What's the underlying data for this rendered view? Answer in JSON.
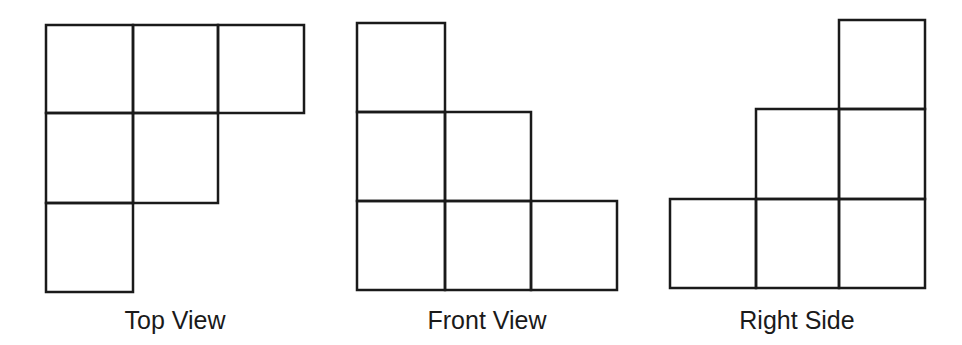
{
  "views": [
    {
      "id": "top",
      "label": "Top View",
      "label_center_x": 175,
      "cells": [
        {
          "row": 0,
          "col": 0,
          "x": 46,
          "y": 25,
          "w": 87,
          "h": 88
        },
        {
          "row": 0,
          "col": 1,
          "x": 133,
          "y": 25,
          "w": 85,
          "h": 88
        },
        {
          "row": 0,
          "col": 2,
          "x": 218,
          "y": 25,
          "w": 86,
          "h": 88
        },
        {
          "row": 1,
          "col": 0,
          "x": 46,
          "y": 113,
          "w": 87,
          "h": 90
        },
        {
          "row": 1,
          "col": 1,
          "x": 133,
          "y": 113,
          "w": 85,
          "h": 90
        },
        {
          "row": 2,
          "col": 0,
          "x": 46,
          "y": 203,
          "w": 87,
          "h": 89
        }
      ]
    },
    {
      "id": "front",
      "label": "Front View",
      "label_center_x": 487,
      "cells": [
        {
          "row": 0,
          "col": 0,
          "x": 357,
          "y": 23,
          "w": 88,
          "h": 89
        },
        {
          "row": 1,
          "col": 0,
          "x": 357,
          "y": 112,
          "w": 88,
          "h": 89
        },
        {
          "row": 1,
          "col": 1,
          "x": 445,
          "y": 112,
          "w": 86,
          "h": 89
        },
        {
          "row": 2,
          "col": 0,
          "x": 357,
          "y": 201,
          "w": 88,
          "h": 89
        },
        {
          "row": 2,
          "col": 1,
          "x": 445,
          "y": 201,
          "w": 86,
          "h": 89
        },
        {
          "row": 2,
          "col": 2,
          "x": 531,
          "y": 201,
          "w": 86,
          "h": 89
        }
      ]
    },
    {
      "id": "right",
      "label": "Right Side",
      "label_center_x": 797,
      "cells": [
        {
          "row": 0,
          "col": 2,
          "x": 839,
          "y": 20,
          "w": 86,
          "h": 89
        },
        {
          "row": 1,
          "col": 1,
          "x": 756,
          "y": 109,
          "w": 83,
          "h": 90
        },
        {
          "row": 1,
          "col": 2,
          "x": 839,
          "y": 109,
          "w": 86,
          "h": 90
        },
        {
          "row": 2,
          "col": 0,
          "x": 670,
          "y": 199,
          "w": 86,
          "h": 89
        },
        {
          "row": 2,
          "col": 1,
          "x": 756,
          "y": 199,
          "w": 83,
          "h": 89
        },
        {
          "row": 2,
          "col": 2,
          "x": 839,
          "y": 199,
          "w": 86,
          "h": 89
        }
      ]
    }
  ],
  "colors": {
    "stroke": "#1a1a1a",
    "background": "#ffffff",
    "text": "#1a1a1a"
  }
}
